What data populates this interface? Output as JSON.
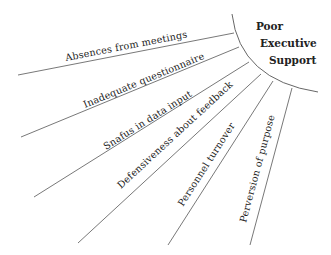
{
  "diagram": {
    "type": "fishbone-segment",
    "effect": {
      "lines": [
        "Poor",
        "Executive",
        "Support"
      ]
    },
    "causes": [
      {
        "label": "Absences from meetings"
      },
      {
        "label": "Inadequate questionnaire"
      },
      {
        "label": "Snafus in data input"
      },
      {
        "label": "Defensiveness about feedback"
      },
      {
        "label": "Personnel turnover"
      },
      {
        "label": "Perversion of purpose"
      }
    ],
    "colors": {
      "line": "#555555",
      "text": "#222222",
      "background": "#ffffff"
    }
  }
}
